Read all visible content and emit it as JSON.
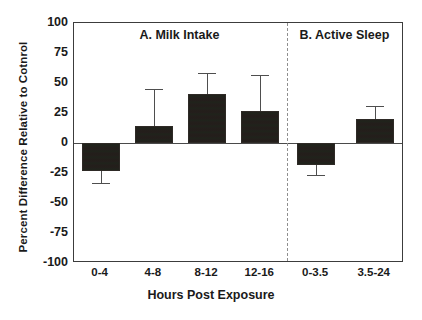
{
  "chart_data": {
    "type": "bar",
    "title": "",
    "xlabel": "Hours Post Exposure",
    "ylabel": "Percent Difference Relative to Cotnrol",
    "ylim": [
      -100,
      100
    ],
    "yticks": [
      100,
      75,
      50,
      25,
      0,
      -25,
      -50,
      -75,
      -100
    ],
    "ytick_labels": [
      "100",
      "75",
      "50",
      "25",
      "0",
      "-25",
      "-50",
      "-75",
      "-100"
    ],
    "grid": false,
    "legend": null,
    "zero_line": 0,
    "panel_divider": true,
    "panels": [
      {
        "key": "A",
        "label": "A. Milk Intake",
        "categories": [
          "0-4",
          "4-8",
          "8-12",
          "12-16"
        ],
        "values": [
          -23,
          14,
          41,
          27
        ],
        "errors": [
          10,
          31,
          17,
          30
        ]
      },
      {
        "key": "B",
        "label": "B. Active Sleep",
        "categories": [
          "0-3.5",
          "3.5-24"
        ],
        "values": [
          -18,
          20
        ],
        "errors": [
          9,
          11
        ]
      }
    ],
    "bar_color": "#231f1c",
    "axis_color": "#3c3c3c",
    "error_color": "#4e4e4e"
  }
}
